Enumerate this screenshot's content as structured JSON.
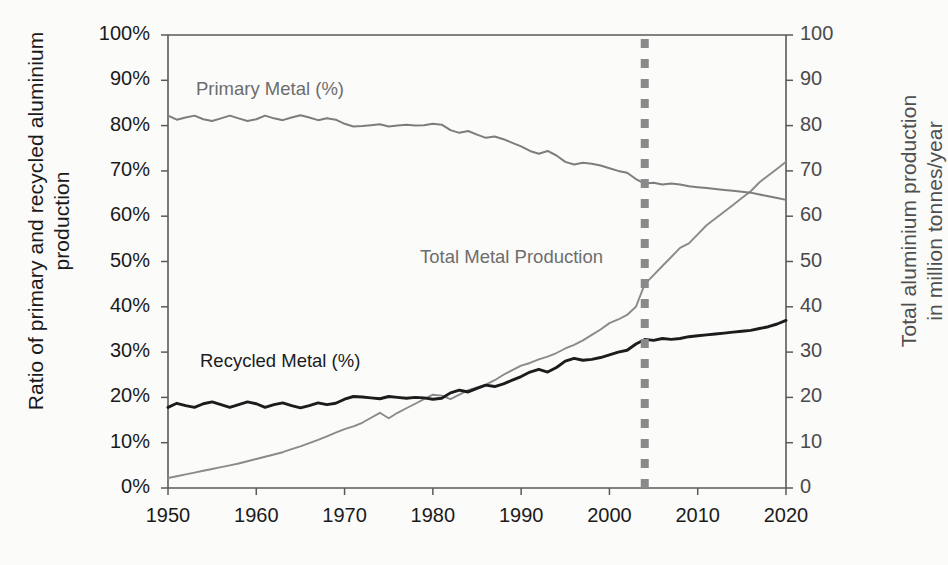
{
  "axes": {
    "left_title": "Ratio of primary and recycled aluminium\nproduction",
    "right_title": "Total aluminium production\nin million tonnes/year",
    "x_title": "",
    "y_left_ticks": [
      "0%",
      "10%",
      "20%",
      "30%",
      "40%",
      "50%",
      "60%",
      "70%",
      "80%",
      "90%",
      "100%"
    ],
    "y_right_ticks": [
      "0",
      "10",
      "20",
      "30",
      "40",
      "50",
      "60",
      "70",
      "80",
      "90",
      "100"
    ],
    "x_ticks": [
      "1950",
      "1960",
      "1970",
      "1980",
      "1990",
      "2000",
      "2010",
      "2020"
    ]
  },
  "labels": {
    "primary": "Primary Metal (%)",
    "recycled": "Recycled Metal (%)",
    "total": "Total Metal Production"
  },
  "colors": {
    "primary": "#7d7d7d",
    "recycled": "#1c1c1c",
    "total": "#8a8a8a",
    "marker_line": "#8a8a8a",
    "axis": "#5a5a5a",
    "background": "#fbfbfa"
  },
  "chart_data": {
    "type": "line",
    "title": "",
    "xlabel": "",
    "ylabel": "Ratio of primary and recycled aluminium production",
    "y2label": "Total aluminium production in million tonnes/year",
    "xlim": [
      1950,
      2020
    ],
    "ylim": [
      0,
      100
    ],
    "y2lim": [
      0,
      100
    ],
    "grid": false,
    "legend": "inline-annotations",
    "annotations": [
      {
        "text": "Primary Metal (%)",
        "x": 1955,
        "y": 90
      },
      {
        "text": "Recycled Metal (%)",
        "x": 1956,
        "y": 29
      },
      {
        "text": "Total Metal Production",
        "x": 1982,
        "y": 52
      },
      {
        "type": "vline",
        "x": 2004,
        "style": "dashed",
        "color": "#8a8a8a",
        "width": 8
      }
    ],
    "x": [
      1950,
      1951,
      1952,
      1953,
      1954,
      1955,
      1956,
      1957,
      1958,
      1959,
      1960,
      1961,
      1962,
      1963,
      1964,
      1965,
      1966,
      1967,
      1968,
      1969,
      1970,
      1971,
      1972,
      1973,
      1974,
      1975,
      1976,
      1977,
      1978,
      1979,
      1980,
      1981,
      1982,
      1983,
      1984,
      1985,
      1986,
      1987,
      1988,
      1989,
      1990,
      1991,
      1992,
      1993,
      1994,
      1995,
      1996,
      1997,
      1998,
      1999,
      2000,
      2001,
      2002,
      2003,
      2004,
      2005,
      2006,
      2007,
      2008,
      2009,
      2010,
      2011,
      2012,
      2013,
      2014,
      2015,
      2016,
      2017,
      2018,
      2019,
      2020
    ],
    "series": [
      {
        "name": "Primary Metal (%)",
        "axis": "left",
        "unit": "%",
        "color": "#7d7d7d",
        "values": [
          82.2,
          81.3,
          81.8,
          82.2,
          81.4,
          81.0,
          81.6,
          82.2,
          81.6,
          81.0,
          81.4,
          82.2,
          81.6,
          81.2,
          81.8,
          82.3,
          81.8,
          81.2,
          81.6,
          81.3,
          80.4,
          79.8,
          79.9,
          80.1,
          80.3,
          79.8,
          80.0,
          80.2,
          80.0,
          80.1,
          80.4,
          80.2,
          79.0,
          78.4,
          78.8,
          78.0,
          77.3,
          77.6,
          77.0,
          76.2,
          75.4,
          74.4,
          73.8,
          74.4,
          73.4,
          72.0,
          71.4,
          71.8,
          71.6,
          71.2,
          70.6,
          70.0,
          69.6,
          68.2,
          67.2,
          67.4,
          67.0,
          67.2,
          67.0,
          66.6,
          66.4,
          66.2,
          66.0,
          65.8,
          65.6,
          65.4,
          65.2,
          64.8,
          64.4,
          64.0,
          63.6
        ]
      },
      {
        "name": "Recycled Metal (%)",
        "axis": "left",
        "unit": "%",
        "color": "#1c1c1c",
        "values": [
          17.8,
          18.7,
          18.2,
          17.8,
          18.6,
          19.0,
          18.4,
          17.8,
          18.4,
          19.0,
          18.6,
          17.8,
          18.4,
          18.8,
          18.2,
          17.7,
          18.2,
          18.8,
          18.4,
          18.7,
          19.6,
          20.2,
          20.1,
          19.9,
          19.7,
          20.2,
          20.0,
          19.8,
          20.0,
          19.9,
          19.6,
          19.8,
          21.0,
          21.6,
          21.2,
          22.0,
          22.7,
          22.4,
          23.0,
          23.8,
          24.6,
          25.6,
          26.2,
          25.6,
          26.6,
          28.0,
          28.6,
          28.2,
          28.4,
          28.8,
          29.4,
          30.0,
          30.4,
          31.8,
          32.8,
          32.6,
          33.0,
          32.8,
          33.0,
          33.4,
          33.6,
          33.8,
          34.0,
          34.2,
          34.4,
          34.6,
          34.8,
          35.2,
          35.6,
          36.2,
          37.0
        ]
      },
      {
        "name": "Total Metal Production",
        "axis": "right",
        "unit": "million tonnes/year",
        "color": "#8a8a8a",
        "values": [
          2.2,
          2.6,
          3.0,
          3.4,
          3.8,
          4.2,
          4.6,
          5.0,
          5.4,
          5.9,
          6.4,
          6.9,
          7.4,
          7.9,
          8.6,
          9.2,
          9.9,
          10.6,
          11.4,
          12.2,
          13.0,
          13.6,
          14.4,
          15.5,
          16.6,
          15.4,
          16.6,
          17.6,
          18.6,
          19.6,
          20.6,
          20.4,
          19.6,
          20.6,
          21.6,
          22.2,
          22.8,
          23.8,
          25.0,
          26.0,
          27.0,
          27.6,
          28.4,
          29.0,
          29.8,
          30.8,
          31.6,
          32.6,
          33.8,
          35.0,
          36.4,
          37.2,
          38.2,
          40.0,
          45.0,
          47.0,
          49.0,
          51.0,
          53.0,
          54.0,
          56.0,
          58.0,
          59.5,
          61.0,
          62.5,
          64.0,
          65.5,
          67.5,
          69.0,
          70.5,
          72.0
        ]
      }
    ]
  }
}
